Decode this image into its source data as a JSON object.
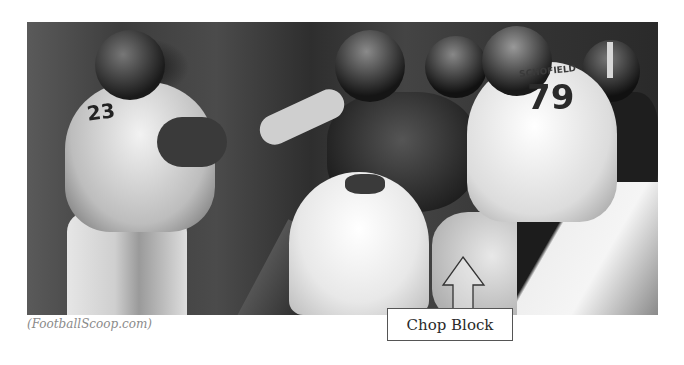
{
  "figure": {
    "image_description": "Grayscale photo of a football play: Denver Broncos players (#23 running back, #79 lineman) engaged with Pittsburgh Steelers players",
    "jersey_numbers": [
      "23",
      "79"
    ],
    "jersey_nameplate": "SCHOFIELD",
    "credit": "(FootballScoop.com)",
    "annotation": {
      "label": "Chop Block",
      "arrow_direction": "up",
      "arrow_icon": "up-arrow-icon"
    }
  }
}
